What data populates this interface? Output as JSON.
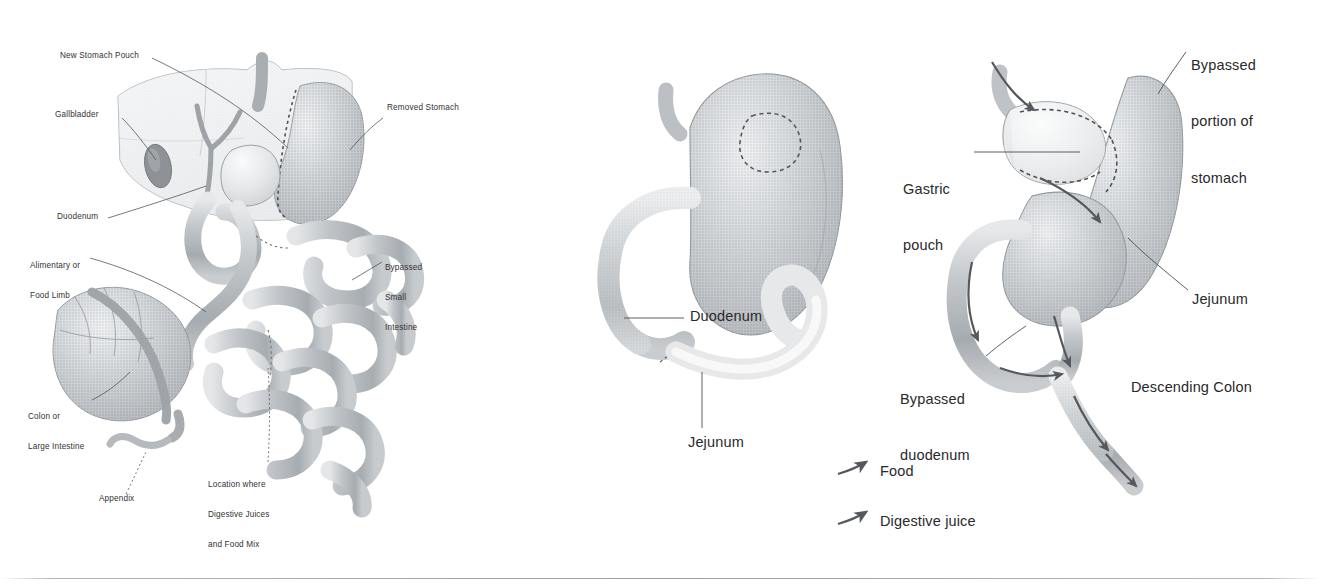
{
  "figure": {
    "background_color": "#ffffff",
    "ink_color": "#2b2b2b",
    "organ_fill_mid": "#b9bcc0",
    "organ_fill_light": "#d9dbdd",
    "organ_fill_pale": "#f0f1f2",
    "organ_stroke": "#8e9295"
  },
  "panels": [
    {
      "id": "panel-left",
      "name": "roux-en-y-overview",
      "labels": [
        {
          "id": "new-stomach-pouch",
          "text": "New Stomach Pouch",
          "x": 60,
          "y": 57,
          "align": "left",
          "lines": [
            "New Stomach Pouch"
          ]
        },
        {
          "id": "gallbladder",
          "text": "Gallbladder",
          "x": 55,
          "y": 116,
          "align": "left",
          "lines": [
            "Gallbladder"
          ]
        },
        {
          "id": "duodenum",
          "text": "Duodenum",
          "x": 57,
          "y": 218,
          "align": "left",
          "lines": [
            "Duodenum"
          ]
        },
        {
          "id": "alimentary-limb",
          "text": "Alimentary or Food Limb",
          "x": 30,
          "y": 247,
          "align": "left",
          "lines": [
            "Alimentary or",
            "Food Limb"
          ]
        },
        {
          "id": "colon-large-intestine",
          "text": "Colon or Large Intestine",
          "x": 28,
          "y": 398,
          "align": "left",
          "lines": [
            "Colon or",
            "Large Intestine"
          ]
        },
        {
          "id": "appendix",
          "text": "Appendix",
          "x": 99,
          "y": 499,
          "align": "left",
          "lines": [
            "Appendix"
          ]
        },
        {
          "id": "digestive-juice-mix",
          "text": "Location where Digestive Juices and Food Mix",
          "x": 208,
          "y": 466,
          "align": "left",
          "lines": [
            "Location where",
            "Digestive Juices",
            "and Food Mix"
          ]
        },
        {
          "id": "removed-stomach",
          "text": "Removed Stomach",
          "x": 387,
          "y": 109,
          "align": "left",
          "lines": [
            "Removed Stomach"
          ]
        },
        {
          "id": "bypassed-small-intestine",
          "text": "Bypassed Small Intestine",
          "x": 385,
          "y": 249,
          "align": "left",
          "lines": [
            "Bypassed",
            "Small",
            "Intestine"
          ]
        }
      ]
    },
    {
      "id": "panel-middle",
      "name": "normal-stomach-anatomy",
      "labels": [
        {
          "id": "mid-duodenum",
          "text": "Duodenum",
          "x": 690,
          "y": 311,
          "align": "left",
          "lines": [
            "Duodenum"
          ]
        },
        {
          "id": "mid-jejunum",
          "text": "Jejunum",
          "x": 688,
          "y": 438,
          "align": "left",
          "lines": [
            "Jejunum"
          ]
        }
      ]
    },
    {
      "id": "panel-right",
      "name": "post-bypass-anatomy",
      "labels": [
        {
          "id": "bypassed-portion-stomach",
          "text": "Bypassed portion of stomach",
          "x": 1191,
          "y": 22,
          "align": "left",
          "lines": [
            "Bypassed",
            "portion of",
            "stomach"
          ]
        },
        {
          "id": "gastric-pouch",
          "text": "Gastric pouch",
          "x": 903,
          "y": 145,
          "align": "left",
          "lines": [
            "Gastric",
            "pouch"
          ]
        },
        {
          "id": "right-jejunum",
          "text": "Jejunum",
          "x": 1192,
          "y": 294,
          "align": "left",
          "lines": [
            "Jejunum"
          ]
        },
        {
          "id": "bypassed-duodenum",
          "text": "Bypassed duodenum",
          "x": 900,
          "y": 355,
          "align": "left",
          "lines": [
            "Bypassed",
            "duodenum"
          ]
        },
        {
          "id": "descending-colon",
          "text": "Descending Colon",
          "x": 1131,
          "y": 382,
          "align": "left",
          "lines": [
            "Descending Colon"
          ]
        }
      ]
    }
  ],
  "legend": {
    "name": "flow-legend",
    "items": [
      {
        "id": "legend-food",
        "label": "Food",
        "x": 880,
        "y": 463,
        "arrow": "curved-arrow-right"
      },
      {
        "id": "legend-digestive-juice",
        "label": "Digestive juice",
        "x": 880,
        "y": 513,
        "arrow": "curved-arrow-right"
      }
    ]
  }
}
